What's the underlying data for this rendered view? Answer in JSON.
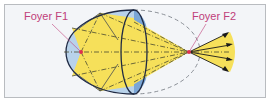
{
  "diagram": {
    "labels": {
      "focus1": "Foyer F1",
      "focus2": "Foyer F2"
    },
    "colors": {
      "background": "#f3f5f8",
      "frame_border": "#b9bcc0",
      "ellipse_fill": "#b8d2ea",
      "lens_fill": "#7aa6d6",
      "beam_fill": "#f6e05a",
      "outline": "#1f2a44",
      "focus_point": "#e0304e",
      "label_color": "#c0407a",
      "dashed_outline": "#8a8f96"
    }
  }
}
